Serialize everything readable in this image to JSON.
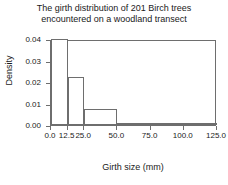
{
  "chart_data": {
    "type": "bar",
    "title": "The girth distribution of 201 Birch trees encountered on a woodland transect",
    "title_line1": "The girth distribution of 201 Birch trees",
    "title_line2": "encountered on a woodland transect",
    "xlabel": "Girth size (mm)",
    "ylabel": "Density",
    "xlim": [
      0.0,
      125.0
    ],
    "ylim": [
      0.0,
      0.04
    ],
    "grid": false,
    "legend": null,
    "bin_edges": [
      0.0,
      12.5,
      25.0,
      50.0,
      75.0,
      100.0,
      125.0
    ],
    "categories": [
      "0.0-12.5",
      "12.5-25.0",
      "25.0-50.0",
      "50.0-75.0",
      "75.0-100.0",
      "100.0-125.0"
    ],
    "values": [
      0.04,
      0.0222,
      0.0074,
      0.0002,
      0.0006,
      0.0002
    ],
    "bars": [
      {
        "x0": 0.0,
        "x1": 12.5,
        "density": 0.04
      },
      {
        "x0": 12.5,
        "x1": 25.0,
        "density": 0.0222
      },
      {
        "x0": 25.0,
        "x1": 50.0,
        "density": 0.0074
      },
      {
        "x0": 50.0,
        "x1": 75.0,
        "density": 0.0002
      },
      {
        "x0": 75.0,
        "x1": 100.0,
        "density": 0.0006
      },
      {
        "x0": 100.0,
        "x1": 125.0,
        "density": 0.0002
      }
    ],
    "xticks": [
      {
        "value": 0.0,
        "label": "0.0"
      },
      {
        "value": 12.5,
        "label": "12.5"
      },
      {
        "value": 25.0,
        "label": "25.0"
      },
      {
        "value": 50.0,
        "label": "50.0"
      },
      {
        "value": 75.0,
        "label": "75.0"
      },
      {
        "value": 100.0,
        "label": "100.0"
      },
      {
        "value": 125.0,
        "label": "125.0"
      }
    ],
    "yticks": [
      {
        "value": 0.0,
        "label": "0.00"
      },
      {
        "value": 0.01,
        "label": "0.01"
      },
      {
        "value": 0.02,
        "label": "0.02"
      },
      {
        "value": 0.03,
        "label": "0.03"
      },
      {
        "value": 0.04,
        "label": "0.04"
      }
    ],
    "colors": {
      "bar_fill": "#ffffff",
      "bar_edge": "#6e6e6e",
      "axis": "#6e6e6e",
      "text": "#1a1a1a",
      "background": "#ffffff"
    }
  }
}
